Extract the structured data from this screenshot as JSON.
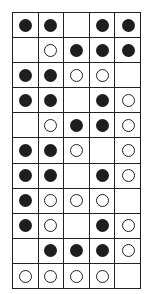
{
  "grid": {
    "columns": 5,
    "rows": 11,
    "legend": {
      "B": "black-circle",
      "W": "white-circle",
      ".": "empty"
    },
    "cells": [
      [
        "B",
        "B",
        ".",
        "B",
        "B"
      ],
      [
        ".",
        "W",
        "B",
        "B",
        "B"
      ],
      [
        "B",
        "B",
        "W",
        "W",
        "."
      ],
      [
        "B",
        "B",
        ".",
        "B",
        "W"
      ],
      [
        ".",
        "W",
        "B",
        "B",
        "W"
      ],
      [
        "B",
        "B",
        "W",
        ".",
        "W"
      ],
      [
        "B",
        "B",
        ".",
        "B",
        "W"
      ],
      [
        "B",
        "W",
        "W",
        "W",
        "."
      ],
      [
        "B",
        "W",
        ".",
        "B",
        "W"
      ],
      [
        ".",
        "B",
        "B",
        "B",
        "W"
      ],
      [
        "W",
        "W",
        "W",
        "W",
        "."
      ]
    ]
  },
  "colors": {
    "black": "#1e1e1e",
    "line": "#222222",
    "background": "#ffffff"
  }
}
